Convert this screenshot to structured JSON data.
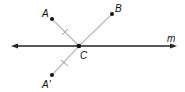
{
  "diagram": {
    "points": {
      "A": {
        "label": "A",
        "x": 52,
        "y": 19
      },
      "B": {
        "label": "B",
        "x": 112,
        "y": 14
      },
      "C": {
        "label": "C",
        "x": 79,
        "y": 46
      },
      "A_prime": {
        "label": "A'",
        "x": 52,
        "y": 75
      }
    },
    "line_m": {
      "label": "m",
      "x1": 12,
      "x2": 176,
      "y": 46
    },
    "colors": {
      "main_line": "#222222",
      "segment": "#bbbbbb",
      "point": "#111111"
    }
  }
}
